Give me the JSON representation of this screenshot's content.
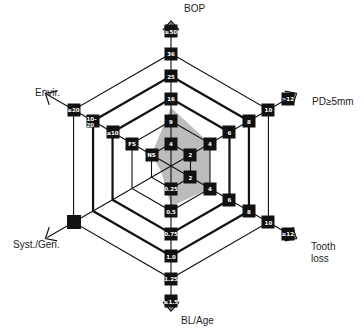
{
  "chart_data": {
    "type": "radar",
    "title": "",
    "center": [
      171,
      166
    ],
    "ring_spacing": 22.5,
    "ring_count": 6,
    "thick_rings": [
      3,
      4
    ],
    "grid": true,
    "axes": [
      {
        "name": "BOP",
        "angle": -90,
        "ticks": [
          "4",
          "9",
          "16",
          "25",
          "36",
          "≥50"
        ],
        "label": "BOP"
      },
      {
        "name": "PD≥5mm",
        "angle": -30,
        "ticks": [
          "2",
          "4",
          "6",
          "8",
          "10",
          ">12"
        ],
        "label": "PD≥5mm"
      },
      {
        "name": "Tooth loss",
        "angle": 30,
        "ticks": [
          "2",
          "4",
          "6",
          "8",
          "10",
          "≥12"
        ],
        "label": "Tooth\nloss"
      },
      {
        "name": "BL/Age",
        "angle": 90,
        "ticks": [
          "0.25",
          "0.5",
          "0.75",
          "1.0",
          "1.25",
          "≥1.5"
        ],
        "label": "BL/Age"
      },
      {
        "name": "Syst./Gen.",
        "angle": 150,
        "ticks": [
          "",
          "",
          "",
          "",
          "",
          ""
        ],
        "label": "Syst./Gen."
      },
      {
        "name": "Envir.",
        "angle": 210,
        "ticks": [
          "NS",
          "FS",
          "≤10",
          "10-20",
          "≥20",
          ""
        ],
        "label": "Envir."
      }
    ],
    "series": [
      {
        "name": "Patient risk profile",
        "color": "#b5b5b5",
        "values": [
          2.6,
          2,
          2,
          1.8,
          0.5,
          1
        ],
        "value_labels": {
          "BOP": "≈12",
          "PD≥5mm": "4",
          "Tooth loss": "4",
          "BL/Age": "≈0.45",
          "Syst./Gen.": "absent",
          "Envir.": "NS"
        }
      }
    ],
    "syst_gen_marker": {
      "level": 5,
      "filled": true
    },
    "legend": null
  },
  "labels": {
    "bop": "BOP",
    "pd": "PD≥5mm",
    "tooth": "Tooth\nloss",
    "bl": "BL/Age",
    "syst": "Syst./Gen.",
    "envir": "Envir."
  }
}
